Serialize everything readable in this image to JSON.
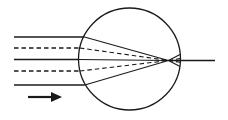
{
  "figure": {
    "caption": "",
    "background_color": "#ffffff",
    "stroke_color": "#1a1a1a",
    "width": 228,
    "height": 120
  },
  "chart_data": {
    "type": "diagram",
    "xlabel": "",
    "ylabel": "",
    "xlim": [
      0,
      228
    ],
    "ylim": [
      0,
      120
    ],
    "grid": false,
    "legend": "none",
    "annotations": [
      {
        "name": "propagation-direction-arrow",
        "label": "",
        "type": "arrow",
        "x1": 28,
        "y1": 97,
        "x2": 62,
        "y2": 97,
        "direction": "right"
      }
    ],
    "elements": [
      {
        "name": "sphere-outline",
        "type": "circle",
        "cx": 129.5,
        "cy": 59,
        "r": 51,
        "stroke": "#1a1a1a",
        "stroke_width": 1.3,
        "fill": "none"
      },
      {
        "name": "focal-point",
        "type": "point",
        "x": 168.5,
        "y": 60.5
      },
      {
        "name": "optical-axis-exit-ray",
        "type": "segment",
        "x1": 168.5,
        "y1": 60.5,
        "x2": 215,
        "y2": 60.5,
        "style": "solid"
      }
    ],
    "rays": [
      {
        "name": "ray-1-solid-upper",
        "style": "solid",
        "incoming_y": 37.0,
        "x_start": 14,
        "entry_x": 84.5,
        "entry_y": 37.0,
        "focus_x": 168.5,
        "focus_y": 60.5,
        "exit_x": 180.0,
        "exit_y": 66.5
      },
      {
        "name": "ray-2-dashed-upper",
        "style": "dashed",
        "incoming_y": 48.0,
        "x_start": 14,
        "entry_x": 79.8,
        "entry_y": 48.0,
        "focus_x": 168.5,
        "focus_y": 60.5,
        "exit_x": 180.0,
        "exit_y": 62.3
      },
      {
        "name": "ray-3-solid-axis",
        "style": "solid",
        "incoming_y": 59.5,
        "x_start": 14,
        "entry_x": 78.5,
        "entry_y": 59.5,
        "focus_x": 168.5,
        "focus_y": 60.5,
        "exit_x": 180.0,
        "exit_y": 60.5
      },
      {
        "name": "ray-4-dashed-lower",
        "style": "dashed",
        "incoming_y": 71.0,
        "x_start": 14,
        "entry_x": 79.9,
        "entry_y": 71.0,
        "focus_x": 168.5,
        "focus_y": 60.5,
        "exit_x": 180.0,
        "exit_y": 58.6
      },
      {
        "name": "ray-5-solid-lower",
        "style": "solid",
        "incoming_y": 85.0,
        "x_start": 14,
        "entry_x": 84.8,
        "entry_y": 85.0,
        "focus_x": 168.5,
        "focus_y": 60.5,
        "exit_x": 180.0,
        "exit_y": 54.5
      }
    ]
  }
}
